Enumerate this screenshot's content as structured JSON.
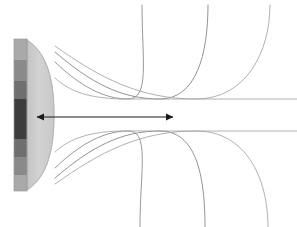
{
  "figure": {
    "title": "Focused ultrasound transducer beam profile",
    "background_color": "#ffffff",
    "width": 297,
    "height": 227
  },
  "transducer": {
    "label": "transducer-stack",
    "x": 14,
    "y": 39,
    "width": 13,
    "height": 152,
    "outline_color": "#9a9a9a",
    "bands": [
      {
        "name": "band-top-light",
        "y": 39,
        "height": 21,
        "color": "#a9a9a9"
      },
      {
        "name": "band-upper-mid",
        "y": 60,
        "height": 21,
        "color": "#8a8a8a"
      },
      {
        "name": "band-upper-dark",
        "y": 81,
        "height": 18,
        "color": "#6f6f6f"
      },
      {
        "name": "band-core-dark",
        "y": 99,
        "height": 40,
        "color": "#3d3d3d"
      },
      {
        "name": "band-lower-dark",
        "y": 139,
        "height": 18,
        "color": "#6f6f6f"
      },
      {
        "name": "band-lower-mid",
        "y": 157,
        "height": 18,
        "color": "#8a8a8a"
      },
      {
        "name": "band-bottom-light",
        "y": 175,
        "height": 16,
        "color": "#a9a9a9"
      }
    ]
  },
  "lens": {
    "label": "acoustic-lens",
    "fill_color": "#cfcfcf",
    "edge_color": "#b3b3b3",
    "apex_x": 54,
    "top_y": 40,
    "bottom_y": 190,
    "base_x": 27
  },
  "beam": {
    "stroke_color": "#7d7d7d",
    "stroke_color_light": "#b0b0b0",
    "stroke_width": 0.9,
    "waist_y_upper": 97,
    "waist_y_lower": 133,
    "aperture_top_y": 46,
    "aperture_bottom_y": 184,
    "upper_curves": [
      {
        "name": "beam-edge-upper-1",
        "from_y": 62,
        "exit_x": 142
      },
      {
        "name": "beam-edge-upper-2",
        "from_y": 52,
        "exit_x": 208
      },
      {
        "name": "beam-edge-upper-3",
        "from_y": 46,
        "exit_x": 270
      }
    ],
    "lower_curves": [
      {
        "name": "beam-edge-lower-1",
        "from_y": 168,
        "exit_x": 140
      },
      {
        "name": "beam-edge-lower-2",
        "from_y": 178,
        "exit_x": 205
      },
      {
        "name": "beam-edge-lower-3",
        "from_y": 184,
        "exit_x": 268
      }
    ]
  },
  "focal_arrow": {
    "label": "focal-zone-arrow",
    "color": "#1a1a1a",
    "y": 117,
    "x_start": 37,
    "x_end": 173,
    "head_size": 6,
    "caption": ""
  }
}
